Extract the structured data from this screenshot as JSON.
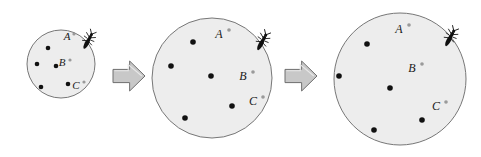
{
  "figure": {
    "type": "diagram",
    "background_color": "#ffffff",
    "circle_fill": "#ededed",
    "circle_stroke": "#777777",
    "dot_color": "#111111",
    "marker_color": "#9a9a9a",
    "arrow_fill": "#c8c8c8",
    "arrow_stroke": "#6e6e6e",
    "insect_color": "#101010",
    "label_color": "#1a1a1a"
  },
  "stages": [
    {
      "name": "stage-1",
      "circle": {
        "cx": 61,
        "cy": 64,
        "r": 34
      },
      "dots": [
        {
          "cx": 48,
          "cy": 48,
          "r": 2.3
        },
        {
          "cx": 37,
          "cy": 64,
          "r": 2.3
        },
        {
          "cx": 56,
          "cy": 66,
          "r": 2.3
        },
        {
          "cx": 68,
          "cy": 84,
          "r": 2.3
        },
        {
          "cx": 41,
          "cy": 87,
          "r": 2.3
        }
      ],
      "labels": [
        {
          "text": "A",
          "x": 67,
          "y": 40,
          "marker_x": 74,
          "marker_y": 34,
          "marker_r": 1.6
        },
        {
          "text": "B",
          "x": 62,
          "y": 66,
          "marker_x": 70,
          "marker_y": 60,
          "marker_r": 1.6
        },
        {
          "text": "C",
          "x": 76,
          "y": 89,
          "marker_x": 84,
          "marker_y": 82,
          "marker_r": 1.6
        }
      ],
      "insect": {
        "x": 88,
        "y": 41,
        "rotation": 28,
        "scale": 1.0
      }
    },
    {
      "name": "stage-2",
      "circle": {
        "cx": 212,
        "cy": 78,
        "r": 60
      },
      "dots": [
        {
          "cx": 193,
          "cy": 42,
          "r": 2.8
        },
        {
          "cx": 171,
          "cy": 66,
          "r": 2.8
        },
        {
          "cx": 211,
          "cy": 76,
          "r": 2.8
        },
        {
          "cx": 232,
          "cy": 106,
          "r": 2.8
        },
        {
          "cx": 185,
          "cy": 118,
          "r": 2.8
        }
      ],
      "labels": [
        {
          "text": "A",
          "x": 219,
          "y": 38,
          "marker_x": 229,
          "marker_y": 30,
          "marker_r": 1.8
        },
        {
          "text": "B",
          "x": 243,
          "y": 80,
          "marker_x": 253,
          "marker_y": 72,
          "marker_r": 1.8
        },
        {
          "text": "C",
          "x": 253,
          "y": 105,
          "marker_x": 263,
          "marker_y": 97,
          "marker_r": 1.8
        }
      ],
      "insect": {
        "x": 262,
        "y": 42,
        "rotation": 28,
        "scale": 1.05
      }
    },
    {
      "name": "stage-3",
      "circle": {
        "cx": 400,
        "cy": 79,
        "r": 66
      },
      "dots": [
        {
          "cx": 367,
          "cy": 44,
          "r": 2.8
        },
        {
          "cx": 339,
          "cy": 76,
          "r": 2.8
        },
        {
          "cx": 390,
          "cy": 88,
          "r": 2.8
        },
        {
          "cx": 422,
          "cy": 120,
          "r": 2.8
        },
        {
          "cx": 374,
          "cy": 130,
          "r": 2.8
        }
      ],
      "labels": [
        {
          "text": "A",
          "x": 399,
          "y": 33,
          "marker_x": 409,
          "marker_y": 25,
          "marker_r": 1.8
        },
        {
          "text": "B",
          "x": 412,
          "y": 72,
          "marker_x": 422,
          "marker_y": 64,
          "marker_r": 1.8
        },
        {
          "text": "C",
          "x": 436,
          "y": 110,
          "marker_x": 446,
          "marker_y": 102,
          "marker_r": 1.8
        }
      ],
      "insect": {
        "x": 450,
        "y": 38,
        "rotation": 28,
        "scale": 1.05
      }
    }
  ],
  "arrows": [
    {
      "name": "arrow-1",
      "x": 113,
      "y": 61,
      "width": 32,
      "height": 30
    },
    {
      "name": "arrow-2",
      "x": 285,
      "y": 61,
      "width": 32,
      "height": 30
    }
  ]
}
